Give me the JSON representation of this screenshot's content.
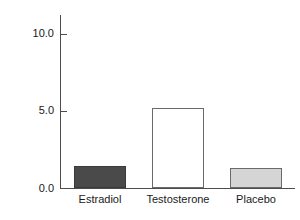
{
  "chart_data": {
    "type": "bar",
    "title": "",
    "subtitle": "",
    "xlabel": "",
    "ylabel": "Frequency of fighting",
    "categories": [
      "Estradiol",
      "Testosterone",
      "Placebo"
    ],
    "values": [
      1.4,
      5.2,
      1.3
    ],
    "series": [
      {
        "name": "Frequency of fighting",
        "values": [
          1.4,
          5.2,
          1.3
        ]
      }
    ],
    "bar_styles": [
      {
        "category": "Estradiol",
        "fill": "#4a4a4a",
        "edge": "#3a3a3a"
      },
      {
        "category": "Testosterone",
        "fill": "#ffffff",
        "edge": "#6a6a6a"
      },
      {
        "category": "Placebo",
        "fill": "#d5d5d5",
        "edge": "#6a6a6a"
      }
    ],
    "ylim": [
      0.0,
      11.2
    ],
    "yticks": [
      0.0,
      5.0,
      10.0
    ],
    "ytick_labels": [
      "0.0",
      "5.0",
      "10.0"
    ],
    "grid": false,
    "legend": false,
    "legend_position": "none",
    "axis_color": "#4d4d4d",
    "tick_direction": "in"
  }
}
